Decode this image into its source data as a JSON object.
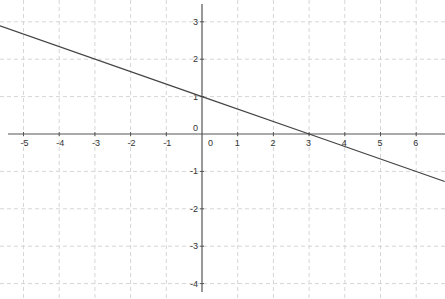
{
  "chart_data": {
    "type": "line",
    "title": "",
    "xlabel": "",
    "ylabel": "",
    "xlim": [
      -5.66,
      6.8
    ],
    "ylim": [
      -4.3,
      3.6
    ],
    "grid": true,
    "x_ticks": [
      -5,
      -4,
      -3,
      -2,
      -1,
      0,
      1,
      2,
      3,
      4,
      5,
      6
    ],
    "y_ticks": [
      -4,
      -3,
      -2,
      -1,
      0,
      1,
      2,
      3
    ],
    "x_tick_labels": [
      "-5",
      "-4",
      "-3",
      "-2",
      "-1",
      "0",
      "1",
      "2",
      "3",
      "4",
      "5",
      "6"
    ],
    "y_tick_labels": [
      "-4",
      "-3",
      "-2",
      "-1",
      "0",
      "1",
      "2",
      "3"
    ],
    "series": [
      {
        "name": "y = -x/3 + 1",
        "slope": -0.3333,
        "intercept": 1,
        "x": [
          -5.66,
          0,
          3,
          6.8
        ],
        "y": [
          2.89,
          1,
          0,
          -1.27
        ]
      }
    ],
    "annotations": [
      {
        "label": "y-intercept",
        "x": 0,
        "y": 1
      },
      {
        "label": "x-intercept",
        "x": 3,
        "y": 0
      }
    ]
  },
  "colors": {
    "background": "#ffffff",
    "axis": "#555555",
    "grid": "#d6d6d6",
    "line": "#444444"
  }
}
